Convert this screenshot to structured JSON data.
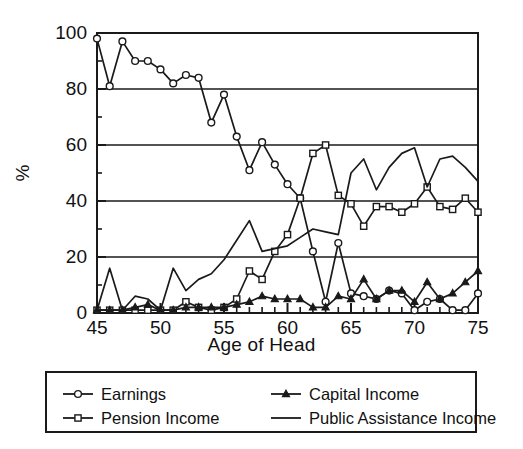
{
  "chart_data": {
    "type": "line",
    "title": "",
    "xlabel": "Age of Head",
    "ylabel": "%",
    "xlim": [
      45,
      75
    ],
    "ylim": [
      0,
      100
    ],
    "xticks": [
      45,
      50,
      55,
      60,
      65,
      70,
      75
    ],
    "yticks": [
      0,
      20,
      40,
      60,
      80,
      100
    ],
    "xminor_step": 1,
    "yminor_step": 10,
    "grid": "horizontal-major",
    "legend_position": "below-plot",
    "x": [
      45,
      46,
      47,
      48,
      49,
      50,
      51,
      52,
      53,
      54,
      55,
      56,
      57,
      58,
      59,
      60,
      61,
      62,
      63,
      64,
      65,
      66,
      67,
      68,
      69,
      70,
      71,
      72,
      73,
      74,
      75
    ],
    "series": [
      {
        "name": "Earnings",
        "marker": "circle",
        "values": [
          98,
          81,
          97,
          90,
          90,
          87,
          82,
          85,
          84,
          68,
          78,
          63,
          51,
          61,
          53,
          46,
          41,
          22,
          4,
          25,
          7,
          6,
          5,
          8,
          7,
          1,
          4,
          5,
          1,
          1,
          7
        ]
      },
      {
        "name": "Pension Income",
        "marker": "square",
        "values": [
          1,
          1,
          1,
          1,
          1,
          1,
          1,
          4,
          2,
          1,
          2,
          5,
          15,
          12,
          22,
          28,
          41,
          57,
          60,
          42,
          39,
          31,
          38,
          38,
          36,
          39,
          45,
          38,
          37,
          41,
          36
        ]
      },
      {
        "name": "Capital Income",
        "marker": "triangle",
        "values": [
          1,
          1,
          1,
          2,
          3,
          1,
          1,
          2,
          2,
          2,
          2,
          3,
          4,
          6,
          5,
          5,
          5,
          2,
          2,
          6,
          5,
          12,
          5,
          8,
          8,
          4,
          11,
          5,
          7,
          11,
          15
        ]
      },
      {
        "name": "Public Assistance Income",
        "marker": "none",
        "values": [
          1,
          16,
          1,
          6,
          5,
          1,
          16,
          8,
          12,
          14,
          19,
          26,
          33,
          22,
          23,
          24,
          27,
          30,
          29,
          28,
          50,
          55,
          44,
          52,
          57,
          59,
          45,
          55,
          56,
          52,
          47
        ]
      }
    ]
  },
  "legend": {
    "entries": [
      {
        "label": "Earnings",
        "marker": "circle"
      },
      {
        "label": "Capital Income",
        "marker": "triangle"
      },
      {
        "label": "Pension Income",
        "marker": "square"
      },
      {
        "label": "Public Assistance Income",
        "marker": "none"
      }
    ]
  },
  "colors": {
    "line": "#1a1a1a",
    "grid": "#1a1a1a",
    "axis": "#1a1a1a",
    "background": "#ffffff",
    "marker_face": "#ffffff"
  }
}
